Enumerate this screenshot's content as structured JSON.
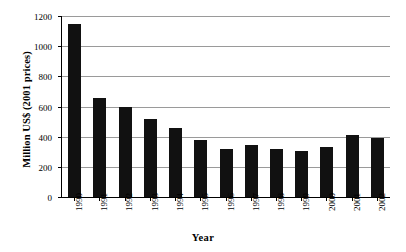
{
  "chart_data": {
    "type": "bar",
    "title": "",
    "xlabel": "Year",
    "ylabel": "Million US$ (2001 prices)",
    "categories": [
      "1990",
      "1991",
      "1992",
      "1993",
      "1994",
      "1995",
      "1996",
      "1997",
      "1998",
      "1999",
      "2000",
      "2001",
      "2002"
    ],
    "values": [
      1150,
      655,
      600,
      520,
      455,
      378,
      320,
      345,
      320,
      307,
      330,
      410,
      393
    ],
    "ylim": [
      0,
      1200
    ],
    "yticks": [
      0,
      200,
      400,
      600,
      800,
      1000,
      1200
    ],
    "ytick_labels": [
      "0",
      "200",
      "400",
      "600",
      "800",
      "1000",
      "1200"
    ],
    "grid": "horizontal",
    "legend": "none",
    "series": [
      {
        "name": "Million US$ (2001 prices)",
        "values": [
          1150,
          655,
          600,
          520,
          455,
          378,
          320,
          345,
          320,
          307,
          330,
          410,
          393
        ]
      }
    ],
    "colors": {
      "bar": "#111111",
      "gridline": "#9a9a9a",
      "axis": "#000000",
      "background": "#ffffff"
    }
  }
}
